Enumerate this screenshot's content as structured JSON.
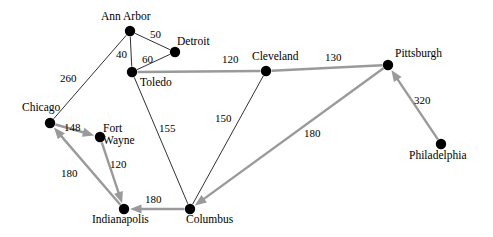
{
  "diagram": {
    "type": "node-link-graph",
    "canvas": {
      "width": 493,
      "height": 237
    },
    "colors": {
      "background": "#ffffff",
      "node_fill": "#000000",
      "thin_edge": "#1a1a1a",
      "gray_edge": "#9a9a9a",
      "label_text": "#000000"
    },
    "nodes": [
      {
        "id": "ann_arbor",
        "label": "Ann Arbor",
        "x": 130,
        "y": 31,
        "r": 5.2,
        "label_x": 101,
        "label_y": 10,
        "lines": 1
      },
      {
        "id": "detroit",
        "label": "Detroit",
        "x": 175,
        "y": 52,
        "r": 5.2,
        "label_x": 177,
        "label_y": 35,
        "lines": 1
      },
      {
        "id": "toledo",
        "label": "Toledo",
        "x": 132,
        "y": 72,
        "r": 5.2,
        "label_x": 140,
        "label_y": 76,
        "lines": 1
      },
      {
        "id": "cleveland",
        "label": "Cleveland",
        "x": 266,
        "y": 71,
        "r": 5.2,
        "label_x": 252,
        "label_y": 50,
        "lines": 1
      },
      {
        "id": "pittsburgh",
        "label": "Pittsburgh",
        "x": 388,
        "y": 65,
        "r": 5.2,
        "label_x": 395,
        "label_y": 47,
        "lines": 1
      },
      {
        "id": "chicago",
        "label": "Chicago",
        "x": 50,
        "y": 123,
        "r": 5.2,
        "label_x": 22,
        "label_y": 101,
        "lines": 1
      },
      {
        "id": "fort_wayne",
        "label": "Fort\nWayne",
        "x": 100,
        "y": 137,
        "r": 5.2,
        "label_x": 103,
        "label_y": 123,
        "lines": 2
      },
      {
        "id": "indianapolis",
        "label": "Indianapolis",
        "x": 124,
        "y": 209,
        "r": 5.2,
        "label_x": 92,
        "label_y": 213,
        "lines": 1
      },
      {
        "id": "columbus",
        "label": "Columbus",
        "x": 190,
        "y": 209,
        "r": 5.2,
        "label_x": 186,
        "label_y": 213,
        "lines": 1
      },
      {
        "id": "philadelphia",
        "label": "Philadelphia",
        "x": 441,
        "y": 144,
        "r": 5.2,
        "label_x": 409,
        "label_y": 149,
        "lines": 1
      }
    ],
    "edges": [
      {
        "id": "ann_arbor-detroit",
        "from": "ann_arbor",
        "to": "detroit",
        "weight": "50",
        "style": "thin",
        "directed": false,
        "label_x": 150,
        "label_y": 29
      },
      {
        "id": "ann_arbor-toledo",
        "from": "ann_arbor",
        "to": "toledo",
        "weight": "40",
        "style": "thin",
        "directed": false,
        "label_x": 116,
        "label_y": 49
      },
      {
        "id": "detroit-toledo",
        "from": "detroit",
        "to": "toledo",
        "weight": "60",
        "style": "thin",
        "directed": false,
        "label_x": 142,
        "label_y": 54
      },
      {
        "id": "chicago-ann_arbor",
        "from": "chicago",
        "to": "ann_arbor",
        "weight": "260",
        "style": "thin",
        "directed": false,
        "label_x": 60,
        "label_y": 73
      },
      {
        "id": "toledo-cleveland",
        "from": "toledo",
        "to": "cleveland",
        "weight": "120",
        "style": "gray",
        "directed": false,
        "label_x": 222,
        "label_y": 54
      },
      {
        "id": "cleveland-pittsburgh",
        "from": "cleveland",
        "to": "pittsburgh",
        "weight": "130",
        "style": "gray",
        "directed": false,
        "label_x": 325,
        "label_y": 52
      },
      {
        "id": "toledo-columbus",
        "from": "toledo",
        "to": "columbus",
        "weight": "155",
        "style": "thin",
        "directed": false,
        "label_x": 159,
        "label_y": 123
      },
      {
        "id": "cleveland-columbus",
        "from": "cleveland",
        "to": "columbus",
        "weight": "150",
        "style": "thin",
        "directed": false,
        "label_x": 215,
        "label_y": 113
      },
      {
        "id": "chicago-fort_wayne",
        "from": "chicago",
        "to": "fort_wayne",
        "weight": "148",
        "style": "gray-directed",
        "directed": true,
        "label_x": 64,
        "label_y": 122
      },
      {
        "id": "fort_wayne-indianapolis",
        "from": "fort_wayne",
        "to": "indianapolis",
        "weight": "120",
        "style": "gray-directed",
        "directed": true,
        "label_x": 110,
        "label_y": 159
      },
      {
        "id": "indianapolis-chicago",
        "from": "indianapolis",
        "to": "chicago",
        "weight": "180",
        "style": "gray-directed",
        "directed": true,
        "label_x": 61,
        "label_y": 168
      },
      {
        "id": "columbus-indianapolis",
        "from": "columbus",
        "to": "indianapolis",
        "weight": "180",
        "style": "gray-directed",
        "directed": true,
        "label_x": 145,
        "label_y": 194
      },
      {
        "id": "pittsburgh-columbus",
        "from": "pittsburgh",
        "to": "columbus",
        "weight": "180",
        "style": "gray-directed",
        "directed": true,
        "label_x": 304,
        "label_y": 128
      },
      {
        "id": "philadelphia-pittsburgh",
        "from": "philadelphia",
        "to": "pittsburgh",
        "weight": "320",
        "style": "gray-directed",
        "directed": true,
        "label_x": 414,
        "label_y": 95
      }
    ]
  }
}
